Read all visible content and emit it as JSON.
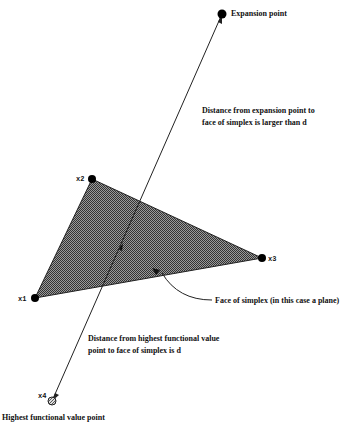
{
  "diagram": {
    "vertices": {
      "x1": {
        "label": "x1",
        "x": 35,
        "y": 298
      },
      "x2": {
        "label": "x2",
        "x": 92,
        "y": 179
      },
      "x3": {
        "label": "x3",
        "x": 262,
        "y": 258
      },
      "x4": {
        "label": "x4",
        "x": 52,
        "y": 401
      }
    },
    "expansion_point": {
      "label": "Expansion point",
      "x": 222,
      "y": 14
    },
    "annotations": {
      "expansion_distance_line1": "Distance from expansion point to",
      "expansion_distance_line2": "face of simplex is larger than d",
      "face_label": "Face of simplex (in this case a plane)",
      "highest_distance_line1": "Distance from highest functional value",
      "highest_distance_line2": "point to face of simplex is d",
      "highest_point_label": "Highest functional value point"
    },
    "colors": {
      "face_fill": "#555555",
      "line": "#222222",
      "point": "#000000"
    }
  }
}
